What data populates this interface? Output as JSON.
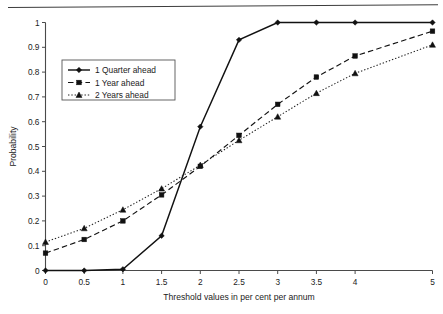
{
  "chart_data": {
    "type": "line",
    "title": "",
    "xlabel": "Threshold values in per cent per annum",
    "ylabel": "Probability",
    "x": [
      0,
      0.5,
      1,
      1.5,
      2,
      2.5,
      3,
      3.5,
      4,
      5
    ],
    "xlim": [
      0,
      5
    ],
    "ylim": [
      0,
      1
    ],
    "xticks": [
      "0",
      "0.5",
      "1",
      "1.5",
      "2",
      "2.5",
      "3",
      "3.5",
      "4",
      "5"
    ],
    "xtick_values": [
      0,
      0.5,
      1,
      1.5,
      2,
      2.5,
      3,
      3.5,
      4,
      5
    ],
    "yticks": [
      "0",
      "0.1",
      "0.2",
      "0.3",
      "0.4",
      "0.5",
      "0.6",
      "0.7",
      "0.8",
      "0.9",
      "1"
    ],
    "ytick_values": [
      0,
      0.1,
      0.2,
      0.3,
      0.4,
      0.5,
      0.6,
      0.7,
      0.8,
      0.9,
      1
    ],
    "grid": false,
    "legend_position": "upper-left-inside",
    "series": [
      {
        "name": "1  Quarter ahead",
        "marker": "diamond",
        "line_style": "solid",
        "color": "#121212",
        "values": [
          0,
          0,
          0.005,
          0.14,
          0.58,
          0.93,
          1.0,
          1.0,
          1.0,
          1.0
        ]
      },
      {
        "name": "1  Year ahead",
        "marker": "square",
        "line_style": "dashed",
        "color": "#121212",
        "values": [
          0.07,
          0.125,
          0.2,
          0.305,
          0.42,
          0.545,
          0.67,
          0.78,
          0.865,
          0.965
        ]
      },
      {
        "name": "2  Years ahead",
        "marker": "triangle",
        "line_style": "dotted",
        "color": "#222222",
        "values": [
          0.115,
          0.17,
          0.245,
          0.33,
          0.425,
          0.525,
          0.62,
          0.715,
          0.795,
          0.91
        ]
      }
    ]
  },
  "legend": {
    "items": [
      {
        "label": "1  Quarter ahead"
      },
      {
        "label": "1  Year ahead"
      },
      {
        "label": "2  Years ahead"
      }
    ]
  },
  "axes": {
    "x_title": "Threshold values in per cent per annum",
    "y_title": "Probability"
  }
}
